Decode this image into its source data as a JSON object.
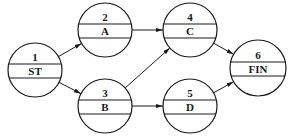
{
  "diagram": {
    "type": "activity-on-node network",
    "nodes": [
      {
        "id": "1",
        "number": "1",
        "name": "ST",
        "cx": 35,
        "cy": 70,
        "r": 27
      },
      {
        "id": "2",
        "number": "2",
        "name": "A",
        "cx": 105,
        "cy": 30,
        "r": 27
      },
      {
        "id": "3",
        "number": "3",
        "name": "B",
        "cx": 105,
        "cy": 106,
        "r": 27
      },
      {
        "id": "4",
        "number": "4",
        "name": "C",
        "cx": 190,
        "cy": 30,
        "r": 27
      },
      {
        "id": "5",
        "number": "5",
        "name": "D",
        "cx": 190,
        "cy": 106,
        "r": 27
      },
      {
        "id": "6",
        "number": "6",
        "name": "FIN",
        "cx": 258,
        "cy": 68,
        "r": 28
      }
    ],
    "edges": [
      {
        "from": "1",
        "to": "2"
      },
      {
        "from": "1",
        "to": "3"
      },
      {
        "from": "2",
        "to": "4"
      },
      {
        "from": "3",
        "to": "4"
      },
      {
        "from": "3",
        "to": "5"
      },
      {
        "from": "4",
        "to": "6"
      },
      {
        "from": "5",
        "to": "6"
      }
    ],
    "colors": {
      "stroke": "#1a1a1a",
      "background": "#ffffff"
    }
  }
}
